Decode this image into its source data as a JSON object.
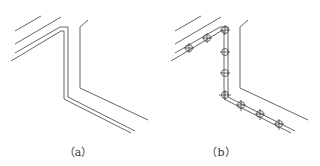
{
  "figure": {
    "panels": [
      {
        "id": "a",
        "caption": "（a）",
        "description": "Z-shaped double-line pipe routing with parallel diagonal lines, no markers"
      },
      {
        "id": "b",
        "caption": "（b）",
        "description": "Same routing with circular crosshair markers placed along the double-line path",
        "markers": [
          {
            "x": 189,
            "y": 48
          },
          {
            "x": 207,
            "y": 38
          },
          {
            "x": 225,
            "y": 30
          },
          {
            "x": 225,
            "y": 52
          },
          {
            "x": 225,
            "y": 73
          },
          {
            "x": 225,
            "y": 95
          },
          {
            "x": 241,
            "y": 105
          },
          {
            "x": 260,
            "y": 114
          },
          {
            "x": 279,
            "y": 124
          }
        ]
      }
    ]
  },
  "colors": {
    "line": "#555555",
    "marker": "#444444",
    "background": "#ffffff"
  }
}
